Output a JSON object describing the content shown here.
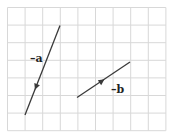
{
  "diagram": {
    "grid": {
      "cols": 9,
      "rows": 7,
      "origin_x": 7.5,
      "origin_y": 7.5,
      "cell": 17.6,
      "line_color": "#d8d8d8"
    },
    "vectors": [
      {
        "id": "neg-a",
        "label": "–a",
        "start": [
          60,
          25.5
        ],
        "end": [
          25,
          115
        ],
        "arrow_at": [
          36,
          87
        ],
        "label_pos": [
          30,
          53
        ],
        "color": "#3a3a3a"
      },
      {
        "id": "neg-b",
        "label": "–b",
        "start": [
          77,
          97.5
        ],
        "end": [
          130,
          62
        ],
        "arrow_at": [
          102,
          81
        ],
        "label_pos": [
          111,
          84
        ],
        "color": "#3a3a3a"
      }
    ]
  }
}
